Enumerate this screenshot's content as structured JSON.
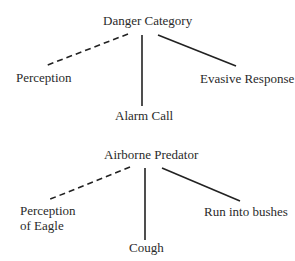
{
  "diagrams": [
    {
      "root": "Danger Category",
      "children": [
        {
          "label": "Perception",
          "edge": "dashed"
        },
        {
          "label": "Alarm Call",
          "edge": "solid"
        },
        {
          "label": "Evasive Response",
          "edge": "solid"
        }
      ]
    },
    {
      "root": "Airborne Predator",
      "children": [
        {
          "label_line1": "Perception",
          "label_line2": "of Eagle",
          "edge": "dashed"
        },
        {
          "label": "Cough",
          "edge": "solid"
        },
        {
          "label": "Run into bushes",
          "edge": "solid"
        }
      ]
    }
  ]
}
